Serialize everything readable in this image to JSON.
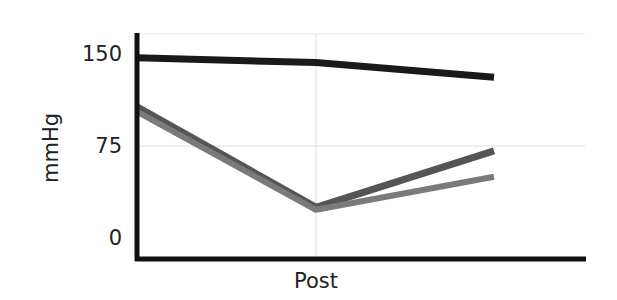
{
  "chart_data": {
    "type": "line",
    "title": "",
    "xlabel": "",
    "ylabel": "mmHg",
    "categories": [
      "",
      "Post",
      ""
    ],
    "category_labels_visible": [
      "Post"
    ],
    "yticks": [
      0,
      75,
      150
    ],
    "ylim": [
      -17,
      167
    ],
    "grid": {
      "horizontal": [
        75,
        150
      ],
      "vertical_at": [
        "Post"
      ]
    },
    "legend": null,
    "series": [
      {
        "name": "series-black",
        "color": "#1a1a1a",
        "values": [
          147,
          143,
          131
        ]
      },
      {
        "name": "series-dark-gray",
        "color": "#555555",
        "values": [
          107,
          25,
          71
        ]
      },
      {
        "name": "series-light-gray",
        "color": "#7a7a7a",
        "values": [
          103,
          23,
          50
        ]
      }
    ]
  },
  "axes": {
    "y_title": "mmHg",
    "y_ticks": [
      "150",
      "75",
      "0"
    ],
    "x_ticks": [
      "Post"
    ]
  }
}
